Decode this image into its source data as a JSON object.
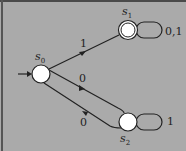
{
  "diagram": {
    "type": "finite-automaton",
    "states": [
      {
        "id": "s0",
        "name": "s",
        "sub": "0",
        "start": true,
        "accepting": false
      },
      {
        "id": "s1",
        "name": "s",
        "sub": "1",
        "start": false,
        "accepting": true
      },
      {
        "id": "s2",
        "name": "s",
        "sub": "2",
        "start": false,
        "accepting": false
      }
    ],
    "transitions": [
      {
        "from": "s0",
        "to": "s1",
        "label": "1"
      },
      {
        "from": "s0",
        "to": "s2",
        "label": "0"
      },
      {
        "from": "s2",
        "to": "s0",
        "label": "0"
      },
      {
        "from": "s1",
        "to": "s1",
        "label": "0,1"
      },
      {
        "from": "s2",
        "to": "s2",
        "label": "1"
      }
    ],
    "colors": {
      "background": "#aaaaaa",
      "state_fill": "#ffffff",
      "stroke": "#2a2a2a"
    }
  }
}
